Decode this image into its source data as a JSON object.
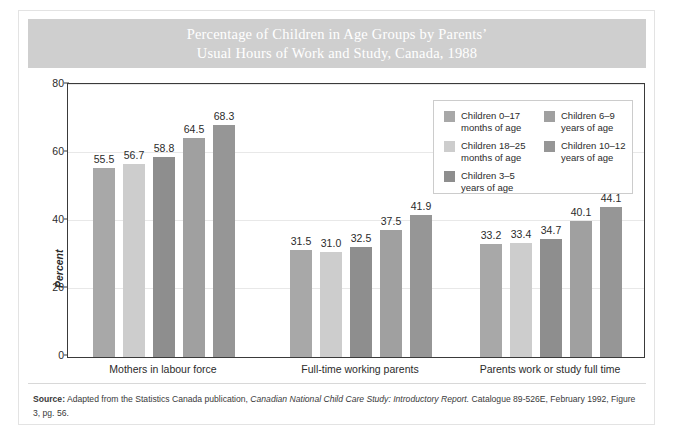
{
  "title": {
    "line1": "Percentage of Children in Age Groups by Parents’",
    "line2": "Usual Hours of Work and Study, Canada, 1988"
  },
  "axis": {
    "ylabel": "Percent",
    "yticks": [
      "0",
      "20",
      "40",
      "60",
      "80"
    ]
  },
  "legend": {
    "entries": [
      {
        "label": "Children 0–17\nmonths of age",
        "color": "#a8a8a8"
      },
      {
        "label": "Children 18–25\nmonths of age",
        "color": "#cdcdcd"
      },
      {
        "label": "Children 3–5\nyears of age",
        "color": "#8e8e8e"
      },
      {
        "label": "Children 6–9\nyears of age",
        "color": "#a0a0a0"
      },
      {
        "label": "Children 10–12\nyears of age",
        "color": "#969696"
      }
    ]
  },
  "source": {
    "label": "Source:",
    "text_part1": " Adapted from the Statistics Canada publication, ",
    "italic_part": "Canadian National Child Care Study: Introductory Report.",
    "text_part2": " Catalogue 89-526E, February 1992, Figure 3, pg. 56."
  },
  "chart_data": {
    "type": "bar",
    "title": "Percentage of Children in Age Groups by Parents’ Usual Hours of Work and Study, Canada, 1988",
    "xlabel": "",
    "ylabel": "Percent",
    "ylim": [
      0,
      80
    ],
    "yticks": [
      0,
      20,
      40,
      60,
      80
    ],
    "grid": true,
    "legend_position": "inside-top-right",
    "categories": [
      "Mothers in labour force",
      "Full-time working parents",
      "Parents work or study full time"
    ],
    "series": [
      {
        "name": "Children 0–17 months of age",
        "color": "#a8a8a8",
        "values": [
          55.5,
          31.5,
          33.2
        ]
      },
      {
        "name": "Children 18–25 months of age",
        "color": "#cdcdcd",
        "values": [
          56.7,
          31.0,
          33.4
        ]
      },
      {
        "name": "Children 3–5 years of age",
        "color": "#8e8e8e",
        "values": [
          58.8,
          32.5,
          34.7
        ]
      },
      {
        "name": "Children 6–9 years of age",
        "color": "#a0a0a0",
        "values": [
          64.5,
          37.5,
          40.1
        ]
      },
      {
        "name": "Children 10–12 years of age",
        "color": "#969696",
        "values": [
          68.3,
          41.9,
          44.1
        ]
      }
    ],
    "data_labels": [
      [
        "55.5",
        "56.7",
        "58.8",
        "64.5",
        "68.3"
      ],
      [
        "31.5",
        "31.0",
        "32.5",
        "37.5",
        "41.9"
      ],
      [
        "33.2",
        "33.4",
        "34.7",
        "40.1",
        "44.1"
      ]
    ]
  }
}
